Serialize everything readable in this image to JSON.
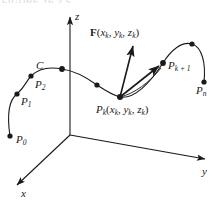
{
  "figure": {
    "kind": "3d-vector-field-line-integral-diagram",
    "background_color": "#ffffff",
    "ink_color": "#1a1a1a",
    "cropped_header_text": "FIGURE 16.2.5"
  },
  "axes": {
    "z_label": "z",
    "y_label": "y",
    "x_label": "x",
    "origin": {
      "x": 70,
      "y": 135
    }
  },
  "curve": {
    "label": "C",
    "description": "smooth space curve C from P0 rising through P1, P2, C, across the z axis, dipping to Pk, rising to Pk+1, over a crest and down to Pn"
  },
  "points": [
    {
      "name": "P0",
      "label_main": "P",
      "label_sub": "0",
      "cx": 10,
      "cy": 136
    },
    {
      "name": "P1",
      "label_main": "P",
      "label_sub": "1",
      "cx": 17,
      "cy": 94
    },
    {
      "name": "P2",
      "label_main": "P",
      "label_sub": "2",
      "cx": 31,
      "cy": 76
    },
    {
      "name": "C",
      "label_main": "C",
      "label_sub": "",
      "cx": 62,
      "cy": 69
    },
    {
      "name": "Pmid",
      "label_main": "",
      "label_sub": "",
      "cx": 97,
      "cy": 85
    },
    {
      "name": "Pk",
      "label_main": "P",
      "label_sub": "k",
      "cx": 120,
      "cy": 97
    },
    {
      "name": "Pk1",
      "label_main": "P",
      "label_sub": "k + 1",
      "cx": 163,
      "cy": 63
    },
    {
      "name": "Pcrest",
      "label_main": "",
      "label_sub": "",
      "cx": 192,
      "cy": 44
    },
    {
      "name": "Pn",
      "label_main": "P",
      "label_sub": "n",
      "cx": 204,
      "cy": 82
    }
  ],
  "labels": {
    "C": "C",
    "P0_main": "P",
    "P0_sub": "0",
    "P1_main": "P",
    "P1_sub": "1",
    "P2_main": "P",
    "P2_sub": "2",
    "Pn_main": "P",
    "Pn_sub": "n",
    "Pk1_main": "P",
    "Pk1_sub": "k + 1",
    "Pk_main": "P",
    "Pk_sub": "k",
    "Pk_coords_open": "(",
    "Pk_coords_x": "x",
    "Pk_coords_x_sub": "k",
    "Pk_coords_comma1": ", ",
    "Pk_coords_y": "y",
    "Pk_coords_y_sub": "k",
    "Pk_coords_comma2": ", ",
    "Pk_coords_z": "z",
    "Pk_coords_z_sub": "k",
    "Pk_coords_close": ")",
    "F_main": "F",
    "F_open": "(",
    "F_x": "x",
    "F_x_sub": "k",
    "F_comma1": ", ",
    "F_y": "y",
    "F_y_sub": "k",
    "F_comma2": ", ",
    "F_z": "z",
    "F_z_sub": "k",
    "F_close": ")"
  },
  "vectors": [
    {
      "name": "field-vector-F",
      "from": {
        "x": 120,
        "y": 97
      },
      "to": {
        "x": 133,
        "y": 44
      },
      "label": "F(x_k, y_k, z_k)"
    },
    {
      "name": "secant-vector-to-Pk1",
      "from": {
        "x": 120,
        "y": 97
      },
      "to": {
        "x": 161,
        "y": 65
      },
      "label": ""
    }
  ]
}
